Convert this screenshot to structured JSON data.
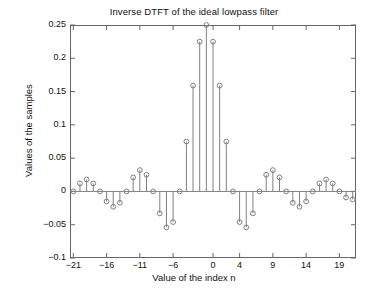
{
  "chart_data": {
    "type": "scatter",
    "plot_style": "stem",
    "title": "Inverse DTFT of the ideal lowpass filter",
    "xlabel": "Value of the index n",
    "ylabel": "Values of the samples",
    "xlim": [
      -21.5,
      21.5
    ],
    "ylim": [
      -0.1,
      0.25
    ],
    "grid": false,
    "legend": null,
    "marker": "circle-open",
    "xticks": [
      -21,
      -16,
      -11,
      -6,
      0,
      4,
      9,
      14,
      19
    ],
    "xtick_labels": [
      "-21",
      "-16",
      "-11",
      "-6",
      "0",
      "4",
      "9",
      "14",
      "19"
    ],
    "yticks": [
      -0.1,
      -0.05,
      0,
      0.05,
      0.1,
      0.15,
      0.2,
      0.25
    ],
    "ytick_labels": [
      "-0.1",
      "-0.05",
      "0",
      "0.05",
      "0.1",
      "0.15",
      "0.2",
      "0.25"
    ],
    "x": [
      -21,
      -20,
      -19,
      -18,
      -17,
      -16,
      -15,
      -14,
      -13,
      -12,
      -11,
      -10,
      -9,
      -8,
      -7,
      -6,
      -5,
      -4,
      -3,
      -2,
      -1,
      0,
      1,
      2,
      3,
      4,
      5,
      6,
      7,
      8,
      9,
      10,
      11,
      12,
      13,
      14,
      15,
      16,
      17,
      18,
      19,
      20,
      21
    ],
    "values": [
      0.0,
      0.012,
      0.018,
      0.012,
      0.0,
      -0.015,
      -0.023,
      -0.017,
      0.0,
      0.021,
      0.032,
      0.025,
      0.0,
      -0.033,
      -0.054,
      -0.046,
      0.0,
      0.075,
      0.159,
      0.225,
      0.25,
      0.225,
      0.159,
      0.075,
      0.0,
      -0.046,
      -0.054,
      -0.033,
      0.0,
      0.025,
      0.032,
      0.021,
      0.0,
      -0.017,
      -0.023,
      -0.015,
      0.0,
      0.012,
      0.018,
      0.012,
      0.0,
      -0.009,
      -0.012
    ],
    "peak_value": 0.25,
    "peak_index": 0,
    "colors": {
      "line": "#808080",
      "marker": "#808080",
      "axis": "#666666",
      "text": "#111111"
    }
  }
}
